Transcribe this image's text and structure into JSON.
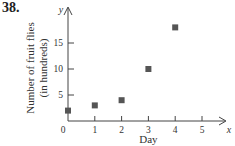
{
  "problem_number": "38.",
  "chart_data": {
    "type": "scatter",
    "title": "",
    "xlabel": "Day",
    "ylabel": "Number of fruit flies (in hundreds)",
    "ylabel_lines": [
      "Number of fruit flies",
      "(in hundreds)"
    ],
    "x_axis_name": "x",
    "y_axis_name": "y",
    "x_ticks": [
      "0",
      "1",
      "2",
      "3",
      "4",
      "5"
    ],
    "y_ticks": [
      "5",
      "10",
      "15"
    ],
    "xlim": [
      0,
      5.7
    ],
    "ylim": [
      0,
      19
    ],
    "grid": false,
    "legend": null,
    "marker": "square",
    "marker_color": "#555555",
    "points": [
      {
        "x": 0,
        "y": 2
      },
      {
        "x": 1,
        "y": 3
      },
      {
        "x": 2,
        "y": 4
      },
      {
        "x": 3,
        "y": 10
      },
      {
        "x": 4,
        "y": 18
      }
    ]
  }
}
